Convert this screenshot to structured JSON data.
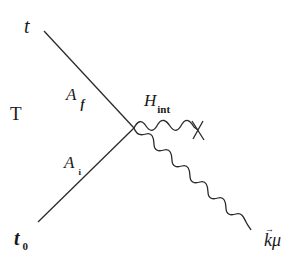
{
  "diagram": {
    "type": "feynman-style interaction diagram",
    "colors": {
      "line": "#2a2a2a",
      "background": "#ffffff",
      "text": "#1a1a1a"
    },
    "labels": {
      "t": "t",
      "tau": "T",
      "a_f_main": "A",
      "a_f_sub": "f",
      "a_i_main": "A",
      "a_i_sub": "i",
      "h_int_main": "H",
      "h_int_sub": "int",
      "t0_main": "t",
      "t0_sub": "0",
      "k_main": "k",
      "k_arrow": "→",
      "k_mu": "μ"
    },
    "elements": [
      {
        "id": "upper-line",
        "kind": "straight",
        "from": [
          44,
          31
        ],
        "to": [
          134,
          128
        ],
        "label": "A_f"
      },
      {
        "id": "lower-line",
        "kind": "straight",
        "from": [
          134,
          128
        ],
        "to": [
          38,
          222
        ],
        "label": "A_i"
      },
      {
        "id": "h-int-wavy",
        "kind": "wavy",
        "from": [
          134,
          128
        ],
        "to": [
          198,
          130
        ],
        "label": "H_int",
        "terminator": "cross"
      },
      {
        "id": "emitted-wavy",
        "kind": "wavy",
        "from": [
          134,
          128
        ],
        "to": [
          251,
          228
        ],
        "label": "k μ"
      }
    ]
  }
}
